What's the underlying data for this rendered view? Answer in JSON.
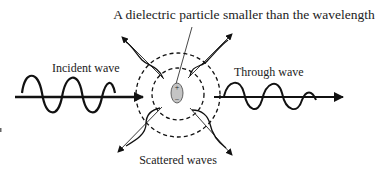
{
  "diagram": {
    "title": "A dielectric particle smaller than the wavelength",
    "labels": {
      "incident": "Incident wave",
      "through": "Through wave",
      "scattered": "Scattered waves"
    },
    "particle": {
      "plus": "+",
      "minus": "−",
      "fill": "#bdbdbd"
    },
    "colors": {
      "stroke": "#111111",
      "text": "#222222"
    }
  }
}
